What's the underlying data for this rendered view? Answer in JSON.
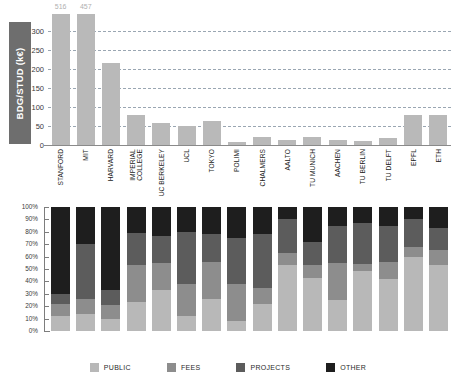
{
  "chart_data": [
    {
      "type": "bar",
      "title": "",
      "ylabel": "BDG/STUD (k€)",
      "xlabel": "",
      "ylim": [
        0,
        320
      ],
      "yticks": [
        0,
        50,
        100,
        150,
        200,
        250,
        300
      ],
      "ytick_labels": [
        "0",
        "50",
        "100",
        "150",
        "200",
        "250",
        "300"
      ],
      "grid": true,
      "legend": "none",
      "bar_color": "#b9b9b9",
      "categories": [
        "STANFORD",
        "MIT",
        "HARVARD",
        "IMPERIAL COLLEGE",
        "UC BERKELEY",
        "UCL",
        "TOKYO",
        "POLIMI",
        "CHALMERS",
        "AALTO",
        "TU MUNICH",
        "AACHEN",
        "TU BERLIN",
        "TU DELFT",
        "EPFL",
        "ETH"
      ],
      "values": [
        516,
        457,
        215,
        78,
        57,
        50,
        63,
        8,
        20,
        12,
        20,
        14,
        11,
        18,
        78,
        80
      ],
      "clipped_bars": [
        {
          "category": "STANFORD",
          "label": "516"
        },
        {
          "category": "MIT",
          "label": "457"
        }
      ],
      "annotations": [
        "Stanford and MIT bars exceed the axis maximum and are annotated with their values above the plot area."
      ]
    },
    {
      "type": "bar",
      "subtype": "stacked-100-percent",
      "title": "",
      "ylabel": "",
      "xlabel": "",
      "ylim": [
        0,
        100
      ],
      "yticks": [
        0,
        10,
        20,
        30,
        40,
        50,
        60,
        70,
        80,
        90,
        100
      ],
      "ytick_labels": [
        "0%",
        "10%",
        "20%",
        "30%",
        "40%",
        "50%",
        "60%",
        "70%",
        "80%",
        "90%",
        "100%"
      ],
      "grid": false,
      "legend": "bottom",
      "categories": [
        "STANFORD",
        "MIT",
        "HARVARD",
        "IMPERIAL COLLEGE",
        "UC BERKELEY",
        "UCL",
        "TOKYO",
        "POLIMI",
        "CHALMERS",
        "AALTO",
        "TU MUNICH",
        "AACHEN",
        "TU BERLIN",
        "TU DELFT",
        "EPFL",
        "ETH"
      ],
      "series": [
        {
          "name": "PUBLIC",
          "color": "#b8b8b8",
          "values": [
            12,
            14,
            10,
            23,
            33,
            12,
            26,
            8,
            22,
            53,
            43,
            25,
            48,
            42,
            60,
            53
          ]
        },
        {
          "name": "FEES",
          "color": "#8d8d8d",
          "values": [
            10,
            12,
            11,
            30,
            22,
            26,
            30,
            30,
            13,
            10,
            10,
            30,
            6,
            14,
            8,
            12
          ]
        },
        {
          "name": "PROJECTS",
          "color": "#5c5c5c",
          "values": [
            8,
            44,
            12,
            26,
            22,
            42,
            22,
            37,
            43,
            27,
            19,
            30,
            33,
            29,
            22,
            18
          ]
        },
        {
          "name": "OTHER",
          "color": "#1e1e1e",
          "values": [
            70,
            30,
            67,
            21,
            23,
            20,
            22,
            25,
            22,
            10,
            28,
            15,
            13,
            15,
            10,
            17
          ]
        }
      ]
    }
  ],
  "top_chart": {
    "ylabel": "BDG/STUD (k€)",
    "yticks": [
      "300",
      "250",
      "200",
      "150",
      "100",
      "50",
      "0"
    ]
  },
  "bottom_chart": {
    "yticks": [
      "100%",
      "90%",
      "80%",
      "70%",
      "60%",
      "50%",
      "40%",
      "30%",
      "20%",
      "10%",
      "0%"
    ]
  },
  "legend": {
    "items": [
      {
        "label": "PUBLIC",
        "color": "#b8b8b8"
      },
      {
        "label": "FEES",
        "color": "#8d8d8d"
      },
      {
        "label": "PROJECTS",
        "color": "#5c5c5c"
      },
      {
        "label": "OTHER",
        "color": "#1e1e1e"
      }
    ]
  },
  "colors": {
    "ylabel_box": "#6e6e6e",
    "gridline": "#9aa6b2",
    "bar": "#b9b9b9",
    "axis": "#7d7d7d"
  }
}
